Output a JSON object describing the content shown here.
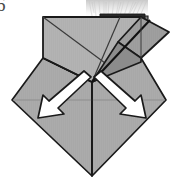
{
  "figure": {
    "kind": "origami-fold-diagram",
    "step_number": "6",
    "caption": "",
    "colors": {
      "paper_front": "#a8a8a8",
      "paper_front_light": "#b4b4b4",
      "paper_back": "#9a9a9a",
      "paper_shadow": "#8e8e8e",
      "outline": "#1a1a1a",
      "fold_line": "#303030",
      "soft_crease": "#8a8a8a",
      "arrow_fill": "#ffffff",
      "arrow_outline": "#1a1a1a",
      "background": "#ffffff",
      "scan_fringe": "#cfcfcf",
      "step_number_color": "#4a4a4a"
    },
    "parts": [
      {
        "name": "upper-flap-panel",
        "label": "upper rectangular flap"
      },
      {
        "name": "upper-right-folded-triangle",
        "label": "right folded-back triangle"
      },
      {
        "name": "lower-diamond-left",
        "label": "lower diamond left half"
      },
      {
        "name": "lower-diamond-right",
        "label": "lower diamond right half"
      },
      {
        "name": "center-vertical-crease",
        "label": "center vertical crease"
      },
      {
        "name": "horizontal-crease",
        "label": "horizontal crease"
      }
    ],
    "arrows": [
      {
        "name": "fold-arrow-left",
        "direction": "down-left",
        "label": "fold left flap down and out"
      },
      {
        "name": "fold-arrow-right",
        "direction": "down-right",
        "label": "fold right flap down and out"
      }
    ],
    "artifacts": [
      {
        "name": "scan-fringe-top",
        "label": "scanned page fringe at top"
      }
    ]
  }
}
